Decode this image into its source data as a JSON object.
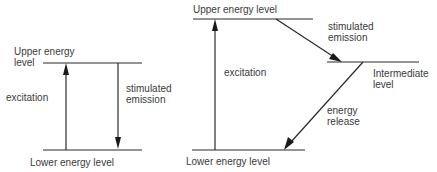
{
  "diagram": {
    "left": {
      "upper_label_line1": "Upper energy",
      "upper_label_line2": "level",
      "excitation_label": "excitation",
      "stimulated_line1": "stimulated",
      "stimulated_line2": "emission",
      "lower_label": "Lower energy level"
    },
    "right": {
      "upper_label": "Upper energy level",
      "excitation_label": "excitation",
      "stimulated_line1": "stimulated",
      "stimulated_line2": "emission",
      "intermediate_line1": "Intermediate",
      "intermediate_line2": "level",
      "release_line1": "energy",
      "release_line2": "release",
      "lower_label": "Lower energy level"
    },
    "colors": {
      "line": "#2a2a2a",
      "text": "#3a3a3a",
      "background": "#ffffff"
    }
  }
}
